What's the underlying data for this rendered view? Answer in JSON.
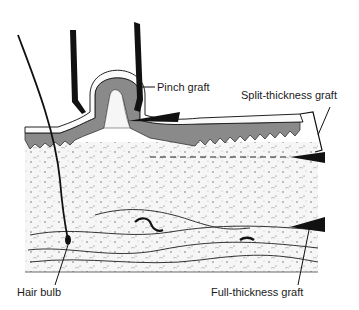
{
  "diagram": {
    "type": "anatomical-illustration",
    "colors": {
      "ink": "#111111",
      "epidermis": "#8a8a8a",
      "dermis": "#f4f4f4",
      "background": "#ffffff"
    },
    "labels": {
      "pinch_graft": "Pinch graft",
      "split_thickness_graft": "Split-thickness graft",
      "hair_bulb": "Hair bulb",
      "full_thickness_graft": "Full-thickness graft"
    }
  }
}
